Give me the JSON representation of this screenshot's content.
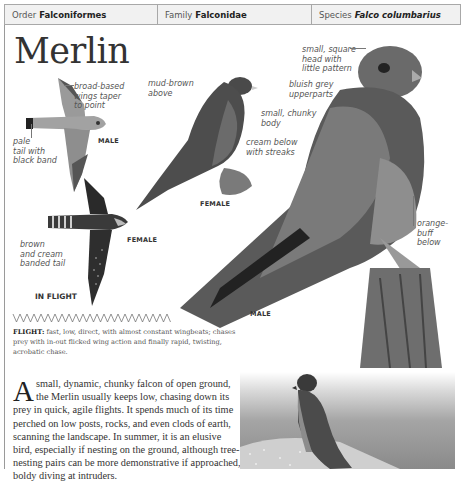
{
  "taxonomy": {
    "order_label": "Order",
    "order_value": "Falconiformes",
    "family_label": "Family",
    "family_value": "Falconidae",
    "species_label": "Species",
    "species_value": "Falco columbarius"
  },
  "title": "Merlin",
  "in_flight": {
    "heading": "IN FLIGHT",
    "male_tag": "MALE",
    "female_tag": "FEMALE",
    "annotations": {
      "wings": [
        "broad-based",
        "wings taper",
        "to point"
      ],
      "male_tail": [
        "pale",
        "tail with",
        "black band"
      ],
      "female_tail": [
        "brown",
        "and cream",
        "banded tail"
      ]
    }
  },
  "female_perched": {
    "tag": "FEMALE",
    "annotations": {
      "above": [
        "mud-brown",
        "above"
      ],
      "below": [
        "cream below",
        "with streaks"
      ]
    }
  },
  "male_perched": {
    "tag": "MALE",
    "annotations": {
      "head": [
        "small, square",
        "head with",
        "little pattern"
      ],
      "upperparts": [
        "bluish grey",
        "upperparts"
      ],
      "body": [
        "small, chunky",
        "body"
      ],
      "below": [
        "orange-",
        "buff",
        "below"
      ]
    }
  },
  "flight_note": {
    "label": "FLIGHT:",
    "text": "fast, low, direct, with almost constant wingbeats; chases prey with in-out flicked wing action and finally rapid, twisting, acrobatic chase."
  },
  "description": {
    "dropcap": "A",
    "text": "small, dynamic, chunky falcon of open ground, the Merlin usually keeps low, chasing down its prey in quick, agile flights. It spends much of its time perched on low posts, rocks, and even clods of earth, scanning the landscape. In summer, it is an elusive bird, especially if nesting on the ground, although tree-nesting pairs can be more demonstrative if approached, boldy diving at intruders."
  },
  "colors": {
    "header_bg": "#f1f1f1",
    "border": "#a8a8a8",
    "text": "#333333"
  }
}
